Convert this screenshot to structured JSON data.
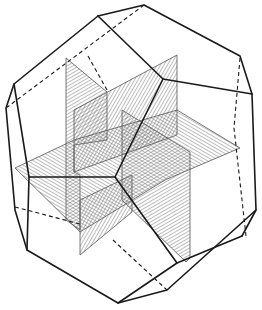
{
  "diagram": {
    "background": "#ffffff",
    "line_color": "#1a1a1a",
    "hatch_color": "#6a6a6a",
    "planes": [
      {
        "name": "vertical-plane-left",
        "points": "66,58 66,215 110,215 110,98"
      },
      {
        "name": "vertical-plane-right",
        "points": "177,55 177,135 122,165 122,300"
      },
      {
        "name": "horizontal-plane",
        "points": "15,175 74,145 240,145 165,200 80,230"
      }
    ],
    "visible_edges": [
      "98,16 144,5 240,56 252,94 256,210 242,236",
      "98,16 14,84 6,108 15,210 27,250 118,303 183,283 256,210",
      "98,16 163,79 252,94",
      "163,79 115,177 29,177",
      "115,177 177,263 242,236",
      "14,84 27,250",
      "118,303 177,263"
    ],
    "hidden_edges": [
      "144,5 6,108",
      "88,56 107,90",
      "240,56 234,128 246,236",
      "15,205 80,226",
      "113,242 165,270"
    ]
  }
}
